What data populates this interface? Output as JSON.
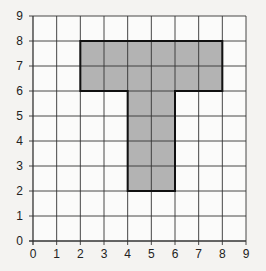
{
  "diagram": {
    "type": "coordinate-grid",
    "x_axis": {
      "min": 0,
      "max": 9,
      "ticks": [
        "0",
        "1",
        "2",
        "3",
        "4",
        "5",
        "6",
        "7",
        "8",
        "9"
      ]
    },
    "y_axis": {
      "min": 0,
      "max": 9,
      "ticks": [
        "0",
        "1",
        "2",
        "3",
        "4",
        "5",
        "6",
        "7",
        "8",
        "9"
      ]
    },
    "shape": {
      "name": "T-shape",
      "vertices": [
        [
          2,
          8
        ],
        [
          8,
          8
        ],
        [
          8,
          6
        ],
        [
          6,
          6
        ],
        [
          6,
          2
        ],
        [
          4,
          2
        ],
        [
          4,
          6
        ],
        [
          2,
          6
        ]
      ],
      "fill": "#b3b3b3",
      "stroke": "#111111"
    },
    "colors": {
      "background": "#f4f3f1",
      "grid": "#333333",
      "grid_fill": "#fbfbfa"
    }
  }
}
